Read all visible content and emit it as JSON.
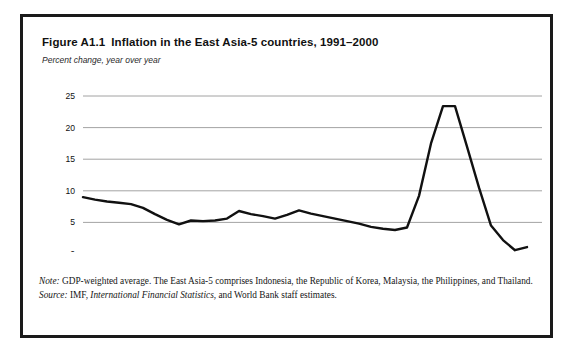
{
  "figure": {
    "number": "Figure A1.1",
    "title": "Inflation in the East Asia-5 countries, 1991–2000",
    "subtitle": "Percent change, year over year"
  },
  "footnotes": {
    "note_label": "Note:",
    "note_text": " GDP-weighted average. The East Asia-5 comprises Indonesia, the Republic of Korea, Malaysia, the Philippines, and Thailand.",
    "source_label": "Source:",
    "source_text_before": " IMF, ",
    "source_publication": "International Financial Statistics",
    "source_text_after": ", and World Bank staff estimates."
  },
  "chart_data": {
    "type": "line",
    "title": "Inflation in the East Asia-5 countries, 1991–2000",
    "subtitle": "Percent change, year over year",
    "xlabel": "",
    "ylabel": "Percent change, year over year",
    "ylim": [
      0,
      25
    ],
    "yticks": [
      0,
      5,
      10,
      15,
      20,
      25
    ],
    "ytick_labels": [
      "0",
      "5",
      "10",
      "15",
      "20",
      "25"
    ],
    "grid": true,
    "grid_axis": "y",
    "legend": false,
    "legend_position": "none",
    "xtick_labels": [
      "Q1 1991",
      "Q1 1992",
      "Q1 1993",
      "Q1 1994",
      "Q1 1995",
      "Q1 1996",
      "Q1 1997",
      "Q1 1998",
      "Q1 1999",
      "Q1 2000"
    ],
    "x_start_label": "Q1 1991",
    "x_end_label": "Q1 2000",
    "x_unit": "quarter",
    "series": [
      {
        "name": "East Asia-5 inflation",
        "color": "#111111",
        "x": [
          "Q1 1991",
          "Q2 1991",
          "Q3 1991",
          "Q4 1991",
          "Q1 1992",
          "Q2 1992",
          "Q3 1992",
          "Q4 1992",
          "Q1 1993",
          "Q2 1993",
          "Q3 1993",
          "Q4 1993",
          "Q1 1994",
          "Q2 1994",
          "Q3 1994",
          "Q4 1994",
          "Q1 1995",
          "Q2 1995",
          "Q3 1995",
          "Q4 1995",
          "Q1 1996",
          "Q2 1996",
          "Q3 1996",
          "Q4 1996",
          "Q1 1997",
          "Q2 1997",
          "Q3 1997",
          "Q4 1997",
          "Q1 1998",
          "Q2 1998",
          "Q3 1998",
          "Q4 1998",
          "Q1 1999",
          "Q2 1999",
          "Q3 1999",
          "Q4 1999",
          "Q1 2000",
          "Q2 2000"
        ],
        "values": [
          9.0,
          8.6,
          8.3,
          8.1,
          7.9,
          7.3,
          6.3,
          5.4,
          4.7,
          5.3,
          5.2,
          5.3,
          5.6,
          6.8,
          6.3,
          6.0,
          5.6,
          6.2,
          6.9,
          6.4,
          6.0,
          5.6,
          5.2,
          4.8,
          4.3,
          4.0,
          3.8,
          4.2,
          9.2,
          17.5,
          23.4,
          23.4,
          17.0,
          10.5,
          4.5,
          2.2,
          0.6,
          1.1
        ]
      }
    ]
  }
}
